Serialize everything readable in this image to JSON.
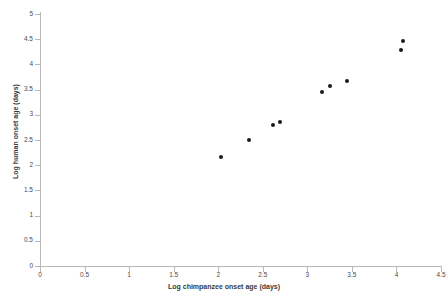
{
  "chart_data": {
    "type": "scatter",
    "title": "",
    "xlabel": "Log chimpanzee onset age (days)",
    "ylabel": "Log human onset age (days)",
    "xlim": [
      0,
      4.5
    ],
    "ylim": [
      0,
      5
    ],
    "xticks": [
      "0",
      "0.5",
      "1",
      "1.5",
      "2",
      "2.5",
      "3",
      "3.5",
      "4",
      "4.5"
    ],
    "xtick_values": [
      0,
      0.5,
      1,
      1.5,
      2,
      2.5,
      3,
      3.5,
      4,
      4.5
    ],
    "yticks": [
      "0",
      "0.5",
      "1",
      "1.5",
      "2",
      "2.5",
      "3",
      "3.5",
      "4",
      "4.5",
      "5"
    ],
    "ytick_values": [
      0,
      0.5,
      1,
      1.5,
      2,
      2.5,
      3,
      3.5,
      4,
      4.5,
      5
    ],
    "grid": false,
    "legend": null,
    "marker": "filled-diamond",
    "marker_color": "#1a1a1a",
    "axis_color": "#b8b8b8",
    "background": "#ffffff",
    "points": [
      {
        "x": 2.03,
        "y": 2.16
      },
      {
        "x": 2.34,
        "y": 2.5
      },
      {
        "x": 2.62,
        "y": 2.79
      },
      {
        "x": 2.69,
        "y": 2.85
      },
      {
        "x": 3.16,
        "y": 3.45
      },
      {
        "x": 3.25,
        "y": 3.58
      },
      {
        "x": 3.45,
        "y": 3.68
      },
      {
        "x": 4.05,
        "y": 4.29
      },
      {
        "x": 4.07,
        "y": 4.46
      }
    ],
    "x": [
      2.03,
      2.34,
      2.62,
      2.69,
      3.16,
      3.25,
      3.45,
      4.05,
      4.07
    ],
    "values": [
      2.16,
      2.5,
      2.79,
      2.85,
      3.45,
      3.58,
      3.68,
      4.29,
      4.46
    ]
  },
  "geometry": {
    "x0_px": 40,
    "x1_px": 441,
    "y0_px": 266,
    "y1_px": 14
  }
}
